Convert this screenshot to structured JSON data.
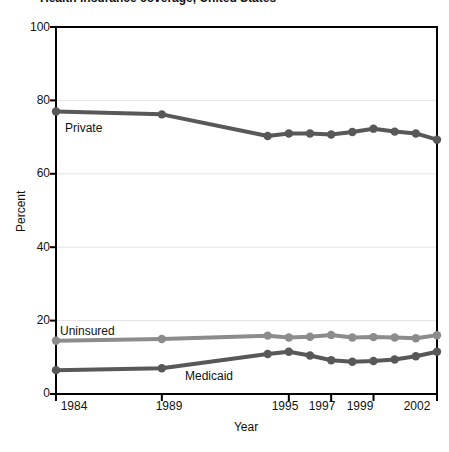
{
  "chart_data": {
    "type": "line",
    "title": "Health insurance coverage, United States",
    "xlabel": "Year",
    "ylabel": "Percent",
    "ylim": [
      0,
      100
    ],
    "yticks": [
      0,
      20,
      40,
      60,
      80,
      100
    ],
    "xticks": [
      1984,
      1989,
      1995,
      1997,
      1999,
      2002
    ],
    "xtick_labels": [
      "1984",
      "1989",
      "1995",
      "1997",
      "1999",
      "2002"
    ],
    "xlim": [
      1984,
      2002
    ],
    "grid": "horizontal-faint",
    "legend": "inline-labels",
    "x": [
      1984,
      1989,
      1994,
      1995,
      1996,
      1997,
      1998,
      1999,
      2000,
      2001,
      2002
    ],
    "series": [
      {
        "name": "Private",
        "color": "#585858",
        "label_position": "inline-below-left",
        "values": [
          77.0,
          76.2,
          70.3,
          71.0,
          71.0,
          70.7,
          71.4,
          72.3,
          71.5,
          71.0,
          69.3
        ]
      },
      {
        "name": "Uninsured",
        "color": "#8c8c8c",
        "label_position": "inline-above-left",
        "values": [
          14.5,
          15.0,
          15.9,
          15.4,
          15.6,
          16.1,
          15.4,
          15.5,
          15.4,
          15.2,
          16.0
        ]
      },
      {
        "name": "Medicaid",
        "color": "#585858",
        "label_position": "inline-below-center",
        "values": [
          6.5,
          7.0,
          10.9,
          11.5,
          10.5,
          9.2,
          8.8,
          9.0,
          9.4,
          10.3,
          11.5
        ]
      }
    ]
  },
  "labels": {
    "ytick_0": "0",
    "ytick_20": "20",
    "ytick_40": "40",
    "ytick_60": "60",
    "ytick_80": "80",
    "ytick_100": "100",
    "xtick_1984": "1984",
    "xtick_1989": "1989",
    "xtick_1995": "1995",
    "xtick_1997": "1997",
    "xtick_1999": "1999",
    "xtick_2002": "2002",
    "axis_x": "Year",
    "axis_y": "Percent",
    "series_private": "Private",
    "series_uninsured": "Uninsured",
    "series_medicaid": "Medicaid"
  },
  "colors": {
    "private": "#585858",
    "uninsured": "#8c8c8c",
    "medicaid": "#585858",
    "axis": "#000000",
    "grid": "#e3e3e3",
    "background": "#ffffff"
  }
}
